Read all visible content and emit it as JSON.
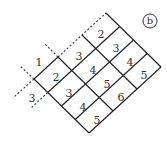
{
  "figure": {
    "label": "b",
    "colors": {
      "line": "#222222",
      "text": "#333333",
      "background": "#ffffff"
    }
  },
  "grid": {
    "rows_along_up_right": 3,
    "cols_along_down_right": 4,
    "cells": [
      [
        2,
        3,
        4,
        5
      ],
      [
        3,
        4,
        5,
        6
      ],
      [
        2,
        3,
        4,
        5
      ]
    ]
  },
  "outside_labels": {
    "top_left": "1",
    "bottom_left": "3"
  },
  "cell_text": {
    "r0c0": "2",
    "r0c1": "3",
    "r0c2": "4",
    "r0c3": "5",
    "r1c0": "3",
    "r1c1": "4",
    "r1c2": "5",
    "r1c3": "6",
    "r2c0": "2",
    "r2c1": "3",
    "r2c2": "4",
    "r2c3": "5"
  }
}
